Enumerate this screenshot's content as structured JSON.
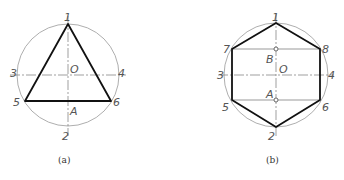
{
  "figures": [
    {
      "id": "a",
      "caption": "(a)",
      "shape": "equilateral triangle inscribed in circle",
      "labels": {
        "p1": "1",
        "p2": "2",
        "p3": "3",
        "p4": "4",
        "p5": "5",
        "p6": "6",
        "O": "O",
        "A": "A"
      }
    },
    {
      "id": "b",
      "caption": "(b)",
      "shape": "regular hexagon inscribed in circle",
      "labels": {
        "p1": "1",
        "p2": "2",
        "p3": "3",
        "p4": "4",
        "p5": "5",
        "p6": "6",
        "p7": "7",
        "p8": "8",
        "O": "O",
        "A": "A",
        "B": "B"
      }
    }
  ],
  "colors": {
    "circle": "#888888",
    "outline": "#111111",
    "centerline": "#777777"
  }
}
